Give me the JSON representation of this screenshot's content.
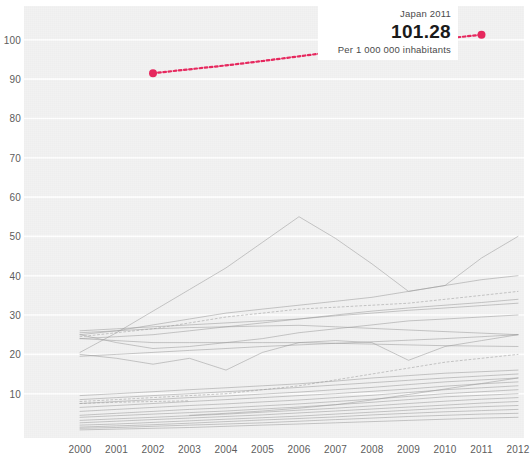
{
  "tooltip": {
    "title": "Japan 2011",
    "value": "101.28",
    "subtitle": "Per 1 000 000 inhabitants"
  },
  "colors": {
    "highlight": "#e8285f",
    "series": "#9a9a9a",
    "plot_background": "#f2f2f2",
    "gridline": "#ffffff",
    "tick_label": "#5c5c5c"
  },
  "chart_data": {
    "type": "line",
    "title": "",
    "subtitle": "",
    "xlabel": "",
    "ylabel": "",
    "xlim": [
      2000,
      2012
    ],
    "ylim": [
      0,
      103
    ],
    "grid": true,
    "legend": "none",
    "x": [
      2000,
      2001,
      2002,
      2003,
      2004,
      2005,
      2006,
      2007,
      2008,
      2009,
      2010,
      2011,
      2012
    ],
    "ytick_labels": [
      "10",
      "20",
      "30",
      "40",
      "50",
      "60",
      "70",
      "80",
      "90",
      "100"
    ],
    "ytick_values": [
      10,
      20,
      30,
      40,
      50,
      60,
      70,
      80,
      90,
      100
    ],
    "xtick_labels": [
      "2000",
      "2001",
      "2002",
      "2003",
      "2004",
      "2005",
      "2006",
      "2007",
      "2008",
      "2009",
      "2010",
      "2011",
      "2012"
    ],
    "annotations": [
      {
        "label": "Japan 2011",
        "x": 2011,
        "y": 101.28,
        "text": "101.28",
        "sub": "Per 1 000 000 inhabitants"
      }
    ],
    "series": [
      {
        "name": "Japan",
        "highlight": true,
        "style": "dotted",
        "color": "#e8285f",
        "x": [
          2002,
          2003,
          2004,
          2005,
          2006,
          2007,
          2008,
          2009,
          2010,
          2011
        ],
        "values": [
          91.5,
          92.5,
          93.5,
          94.6,
          95.8,
          97.0,
          98.2,
          99.3,
          100.3,
          101.28
        ]
      },
      {
        "name": "series-peak-55",
        "highlight": false,
        "style": "mixed",
        "x": [
          2000,
          2001,
          2002,
          2003,
          2004,
          2005,
          2006,
          2007,
          2008,
          2009,
          2010,
          2011,
          2012
        ],
        "values": [
          20.5,
          25.5,
          31.0,
          36.5,
          42.0,
          48.5,
          55.0,
          49.5,
          43.0,
          36.0,
          37.5,
          44.5,
          50.0
        ]
      },
      {
        "name": "series-40",
        "highlight": false,
        "style": "solid",
        "x": [
          2000,
          2001,
          2002,
          2003,
          2004,
          2005,
          2006,
          2007,
          2008,
          2009,
          2010,
          2011,
          2012
        ],
        "values": [
          25.0,
          26.0,
          27.5,
          29.0,
          30.5,
          31.5,
          32.5,
          33.5,
          34.5,
          36.0,
          37.5,
          39.0,
          40.0
        ]
      },
      {
        "name": "series-36-dotted",
        "highlight": false,
        "style": "dotted",
        "x": [
          2000,
          2001,
          2002,
          2003,
          2004,
          2005,
          2006,
          2007,
          2008,
          2009,
          2010,
          2011,
          2012
        ],
        "values": [
          24.5,
          25.5,
          26.5,
          28.0,
          29.5,
          30.5,
          31.5,
          32.0,
          32.5,
          33.0,
          34.0,
          35.0,
          36.0
        ]
      },
      {
        "name": "series-34",
        "highlight": false,
        "style": "solid",
        "x": [
          2000,
          2001,
          2002,
          2003,
          2004,
          2005,
          2006,
          2007,
          2008,
          2009,
          2010,
          2011,
          2012
        ],
        "values": [
          24.0,
          24.5,
          25.0,
          26.0,
          27.0,
          28.0,
          29.0,
          30.0,
          31.0,
          31.8,
          32.5,
          33.2,
          34.0
        ]
      },
      {
        "name": "series-33",
        "highlight": false,
        "style": "solid",
        "x": [
          2000,
          2001,
          2002,
          2003,
          2004,
          2005,
          2006,
          2007,
          2008,
          2009,
          2010,
          2011,
          2012
        ],
        "values": [
          26.0,
          26.5,
          27.0,
          27.5,
          28.0,
          28.5,
          29.0,
          29.8,
          30.5,
          31.2,
          31.8,
          32.4,
          33.0
        ]
      },
      {
        "name": "series-30-dip",
        "highlight": false,
        "style": "solid",
        "x": [
          2000,
          2001,
          2002,
          2003,
          2004,
          2005,
          2006,
          2007,
          2008,
          2009,
          2010,
          2011,
          2012
        ],
        "values": [
          25.0,
          23.0,
          21.5,
          22.0,
          23.0,
          24.0,
          25.5,
          26.5,
          27.5,
          28.5,
          29.0,
          29.5,
          30.0
        ]
      },
      {
        "name": "series-25-v",
        "highlight": false,
        "style": "solid",
        "x": [
          2000,
          2001,
          2002,
          2003,
          2004,
          2005,
          2006,
          2007,
          2008,
          2009,
          2010,
          2011,
          2012
        ],
        "values": [
          20.0,
          19.0,
          17.5,
          19.0,
          16.0,
          20.5,
          23.0,
          23.5,
          23.0,
          18.5,
          22.0,
          23.5,
          25.0
        ]
      },
      {
        "name": "series-22",
        "highlight": false,
        "style": "solid",
        "x": [
          2000,
          2001,
          2002,
          2003,
          2004,
          2005,
          2006,
          2007,
          2008,
          2009,
          2010,
          2011,
          2012
        ],
        "values": [
          24.0,
          23.5,
          23.0,
          23.0,
          23.0,
          23.0,
          23.0,
          22.8,
          22.6,
          22.4,
          22.2,
          22.1,
          22.0
        ]
      },
      {
        "name": "series-20-dotted",
        "highlight": false,
        "style": "dotted",
        "x": [
          2000,
          2001,
          2002,
          2003,
          2004,
          2005,
          2006,
          2007,
          2008,
          2009,
          2010,
          2011,
          2012
        ],
        "values": [
          8.0,
          8.5,
          9.0,
          9.5,
          10.0,
          11.0,
          12.0,
          13.5,
          15.0,
          16.5,
          18.0,
          19.0,
          20.0
        ]
      },
      {
        "name": "series-16",
        "highlight": false,
        "style": "solid",
        "x": [
          2000,
          2001,
          2002,
          2003,
          2004,
          2005,
          2006,
          2007,
          2008,
          2009,
          2010,
          2011,
          2012
        ],
        "values": [
          9.5,
          10.0,
          10.5,
          11.0,
          11.5,
          12.0,
          12.5,
          13.2,
          14.0,
          14.6,
          15.2,
          15.6,
          16.0
        ]
      },
      {
        "name": "series-15",
        "highlight": false,
        "style": "solid",
        "x": [
          2000,
          2001,
          2002,
          2003,
          2004,
          2005,
          2006,
          2007,
          2008,
          2009,
          2010,
          2011,
          2012
        ],
        "values": [
          8.5,
          9.0,
          9.5,
          10.0,
          10.5,
          11.0,
          11.6,
          12.2,
          12.8,
          13.4,
          14.0,
          14.5,
          15.0
        ]
      },
      {
        "name": "series-14",
        "highlight": false,
        "style": "solid",
        "x": [
          2000,
          2001,
          2002,
          2003,
          2004,
          2005,
          2006,
          2007,
          2008,
          2009,
          2010,
          2011,
          2012
        ],
        "values": [
          7.5,
          8.0,
          8.5,
          9.0,
          9.4,
          9.9,
          10.4,
          11.0,
          11.6,
          12.3,
          13.0,
          13.5,
          14.0
        ]
      },
      {
        "name": "series-13",
        "highlight": false,
        "style": "solid",
        "x": [
          2000,
          2001,
          2002,
          2003,
          2004,
          2005,
          2006,
          2007,
          2008,
          2009,
          2010,
          2011,
          2012
        ],
        "values": [
          6.5,
          7.0,
          7.5,
          8.0,
          8.5,
          9.0,
          9.5,
          10.0,
          10.6,
          11.2,
          11.9,
          12.5,
          13.0
        ]
      },
      {
        "name": "series-12",
        "highlight": false,
        "style": "solid",
        "x": [
          2000,
          2001,
          2002,
          2003,
          2004,
          2005,
          2006,
          2007,
          2008,
          2009,
          2010,
          2011,
          2012
        ],
        "values": [
          5.5,
          6.0,
          6.5,
          7.0,
          7.4,
          7.9,
          8.4,
          9.0,
          9.6,
          10.3,
          11.0,
          11.5,
          12.0
        ]
      },
      {
        "name": "series-11",
        "highlight": false,
        "style": "solid",
        "x": [
          2000,
          2001,
          2002,
          2003,
          2004,
          2005,
          2006,
          2007,
          2008,
          2009,
          2010,
          2011,
          2012
        ],
        "values": [
          4.5,
          5.0,
          5.5,
          6.0,
          6.4,
          6.9,
          7.4,
          8.0,
          8.6,
          9.3,
          10.0,
          10.5,
          11.0
        ]
      },
      {
        "name": "series-10",
        "highlight": false,
        "style": "solid",
        "x": [
          2000,
          2001,
          2002,
          2003,
          2004,
          2005,
          2006,
          2007,
          2008,
          2009,
          2010,
          2011,
          2012
        ],
        "values": [
          4.0,
          4.4,
          4.8,
          5.2,
          5.6,
          6.1,
          6.6,
          7.2,
          7.8,
          8.5,
          9.2,
          9.6,
          10.0
        ]
      },
      {
        "name": "series-9",
        "highlight": false,
        "style": "solid",
        "x": [
          2000,
          2001,
          2002,
          2003,
          2004,
          2005,
          2006,
          2007,
          2008,
          2009,
          2010,
          2011,
          2012
        ],
        "values": [
          3.2,
          3.6,
          4.0,
          4.4,
          4.8,
          5.3,
          5.8,
          6.3,
          6.9,
          7.5,
          8.1,
          8.6,
          9.0
        ]
      },
      {
        "name": "series-8",
        "highlight": false,
        "style": "solid",
        "x": [
          2000,
          2001,
          2002,
          2003,
          2004,
          2005,
          2006,
          2007,
          2008,
          2009,
          2010,
          2011,
          2012
        ],
        "values": [
          2.6,
          3.0,
          3.4,
          3.8,
          4.2,
          4.6,
          5.1,
          5.6,
          6.1,
          6.6,
          7.1,
          7.6,
          8.0
        ]
      },
      {
        "name": "series-7",
        "highlight": false,
        "style": "solid",
        "x": [
          2000,
          2001,
          2002,
          2003,
          2004,
          2005,
          2006,
          2007,
          2008,
          2009,
          2010,
          2011,
          2012
        ],
        "values": [
          2.0,
          2.3,
          2.7,
          3.1,
          3.5,
          3.9,
          4.3,
          4.8,
          5.3,
          5.8,
          6.3,
          6.7,
          7.0
        ]
      },
      {
        "name": "series-6",
        "highlight": false,
        "style": "solid",
        "x": [
          2000,
          2001,
          2002,
          2003,
          2004,
          2005,
          2006,
          2007,
          2008,
          2009,
          2010,
          2011,
          2012
        ],
        "values": [
          1.5,
          1.8,
          2.1,
          2.5,
          2.9,
          3.3,
          3.7,
          4.1,
          4.6,
          5.0,
          5.4,
          5.7,
          6.0
        ]
      },
      {
        "name": "series-5",
        "highlight": false,
        "style": "solid",
        "x": [
          2000,
          2001,
          2002,
          2003,
          2004,
          2005,
          2006,
          2007,
          2008,
          2009,
          2010,
          2011,
          2012
        ],
        "values": [
          1.2,
          1.4,
          1.7,
          2.0,
          2.3,
          2.6,
          3.0,
          3.4,
          3.8,
          4.2,
          4.5,
          4.8,
          5.0
        ]
      },
      {
        "name": "series-4-flat",
        "highlight": false,
        "style": "solid",
        "x": [
          2000,
          2001,
          2002,
          2003,
          2004,
          2005,
          2006,
          2007,
          2008,
          2009,
          2010,
          2011,
          2012
        ],
        "values": [
          0.8,
          1.0,
          1.2,
          1.4,
          1.7,
          2.0,
          2.3,
          2.6,
          2.9,
          3.2,
          3.5,
          3.8,
          4.0
        ]
      },
      {
        "name": "series-mid-28",
        "highlight": false,
        "style": "solid",
        "x": [
          2000,
          2001,
          2002,
          2003,
          2004,
          2005,
          2006,
          2007,
          2008,
          2009,
          2010,
          2011,
          2012
        ],
        "values": [
          25.5,
          26.0,
          26.5,
          26.8,
          27.0,
          27.2,
          27.4,
          27.0,
          26.6,
          26.2,
          25.8,
          25.4,
          25.0
        ]
      },
      {
        "name": "series-short-9",
        "highlight": false,
        "style": "dotted",
        "x": [
          2000,
          2001,
          2002,
          2003
        ],
        "values": [
          7.5,
          7.8,
          8.0,
          8.2
        ]
      },
      {
        "name": "series-late-15",
        "highlight": false,
        "style": "solid",
        "x": [
          2003,
          2004,
          2005,
          2006,
          2007,
          2008,
          2009,
          2010,
          2011,
          2012
        ],
        "values": [
          4.5,
          5.0,
          5.6,
          6.3,
          7.2,
          8.4,
          9.8,
          11.2,
          12.6,
          14.0
        ]
      },
      {
        "name": "series-cross-21",
        "highlight": false,
        "style": "solid",
        "x": [
          2000,
          2001,
          2002,
          2003,
          2004,
          2005,
          2006,
          2007,
          2008,
          2009,
          2010,
          2011,
          2012
        ],
        "values": [
          19.5,
          20.0,
          20.5,
          21.0,
          21.5,
          22.0,
          22.4,
          22.8,
          23.2,
          23.6,
          24.0,
          24.5,
          25.0
        ]
      }
    ]
  }
}
